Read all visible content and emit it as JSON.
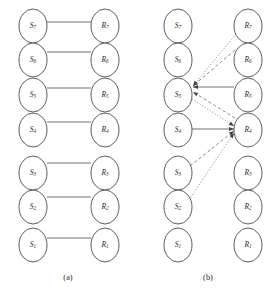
{
  "figure": {
    "background_color": "#ffffff",
    "stroke_color": "#4a4a4a",
    "panels": [
      {
        "id": "panel-a",
        "caption": "(a)",
        "caption_x": 68,
        "caption_y": 278,
        "source_column_x": 33,
        "receiver_column_x": 105,
        "nodes": [
          {
            "id": "a-s7",
            "base": "S",
            "sub": "7",
            "x": 33,
            "y": 26,
            "rx": 14,
            "ry": 17
          },
          {
            "id": "a-s6",
            "base": "S",
            "sub": "6",
            "x": 33,
            "y": 60,
            "rx": 14,
            "ry": 17
          },
          {
            "id": "a-s5",
            "base": "S",
            "sub": "5",
            "x": 33,
            "y": 95,
            "rx": 14,
            "ry": 17
          },
          {
            "id": "a-s4",
            "base": "S",
            "sub": "4",
            "x": 33,
            "y": 130,
            "rx": 14,
            "ry": 17
          },
          {
            "id": "a-s3",
            "base": "S",
            "sub": "3",
            "x": 33,
            "y": 173,
            "rx": 14,
            "ry": 17
          },
          {
            "id": "a-s2",
            "base": "S",
            "sub": "2",
            "x": 33,
            "y": 207,
            "rx": 14,
            "ry": 17
          },
          {
            "id": "a-s1",
            "base": "S",
            "sub": "1",
            "x": 33,
            "y": 245,
            "rx": 14,
            "ry": 17
          },
          {
            "id": "a-r7",
            "base": "R",
            "sub": "7",
            "x": 105,
            "y": 26,
            "rx": 14,
            "ry": 17
          },
          {
            "id": "a-r6",
            "base": "R",
            "sub": "6",
            "x": 105,
            "y": 60,
            "rx": 14,
            "ry": 17
          },
          {
            "id": "a-r5",
            "base": "R",
            "sub": "5",
            "x": 105,
            "y": 95,
            "rx": 14,
            "ry": 17
          },
          {
            "id": "a-r4",
            "base": "R",
            "sub": "4",
            "x": 105,
            "y": 130,
            "rx": 14,
            "ry": 17
          },
          {
            "id": "a-r3",
            "base": "R",
            "sub": "3",
            "x": 105,
            "y": 173,
            "rx": 14,
            "ry": 17
          },
          {
            "id": "a-r2",
            "base": "R",
            "sub": "2",
            "x": 105,
            "y": 207,
            "rx": 14,
            "ry": 17
          },
          {
            "id": "a-r1",
            "base": "R",
            "sub": "1",
            "x": 105,
            "y": 245,
            "rx": 14,
            "ry": 17
          }
        ],
        "edges": [
          {
            "id": "a-e7",
            "from": "a-s7",
            "to": "a-r7",
            "style": "solid",
            "arrow": "none",
            "x1": 47,
            "y1": 22,
            "x2": 91,
            "y2": 22
          },
          {
            "id": "a-e6",
            "from": "a-s6",
            "to": "a-r6",
            "style": "solid",
            "arrow": "none",
            "x1": 47,
            "y1": 52,
            "x2": 91,
            "y2": 52
          },
          {
            "id": "a-e5",
            "from": "a-s5",
            "to": "a-r5",
            "style": "solid",
            "arrow": "none",
            "x1": 47,
            "y1": 88,
            "x2": 91,
            "y2": 88
          },
          {
            "id": "a-e4",
            "from": "a-s4",
            "to": "a-r4",
            "style": "solid",
            "arrow": "none",
            "x1": 47,
            "y1": 122,
            "x2": 91,
            "y2": 122
          },
          {
            "id": "a-e3",
            "from": "a-s3",
            "to": "a-r3",
            "style": "solid",
            "arrow": "none",
            "x1": 47,
            "y1": 163,
            "x2": 91,
            "y2": 163
          },
          {
            "id": "a-e2",
            "from": "a-s2",
            "to": "a-r2",
            "style": "solid",
            "arrow": "none",
            "x1": 47,
            "y1": 197,
            "x2": 91,
            "y2": 197
          },
          {
            "id": "a-e1",
            "from": "a-s1",
            "to": "a-r1",
            "style": "solid",
            "arrow": "none",
            "x1": 47,
            "y1": 238,
            "x2": 91,
            "y2": 238
          }
        ]
      },
      {
        "id": "panel-b",
        "caption": "(b)",
        "caption_x": 208,
        "caption_y": 278,
        "source_column_x": 178,
        "receiver_column_x": 248,
        "nodes": [
          {
            "id": "b-s7",
            "base": "S",
            "sub": "7",
            "x": 178,
            "y": 26,
            "rx": 14,
            "ry": 17
          },
          {
            "id": "b-s6",
            "base": "S",
            "sub": "6",
            "x": 178,
            "y": 60,
            "rx": 14,
            "ry": 17
          },
          {
            "id": "b-s5",
            "base": "S",
            "sub": "5",
            "x": 178,
            "y": 95,
            "rx": 14,
            "ry": 17
          },
          {
            "id": "b-s4",
            "base": "S",
            "sub": "4",
            "x": 178,
            "y": 130,
            "rx": 14,
            "ry": 17
          },
          {
            "id": "b-s3",
            "base": "S",
            "sub": "3",
            "x": 178,
            "y": 173,
            "rx": 14,
            "ry": 17
          },
          {
            "id": "b-s2",
            "base": "S",
            "sub": "2",
            "x": 178,
            "y": 207,
            "rx": 14,
            "ry": 17
          },
          {
            "id": "b-s1",
            "base": "S",
            "sub": "1",
            "x": 178,
            "y": 245,
            "rx": 14,
            "ry": 17
          },
          {
            "id": "b-r7",
            "base": "R",
            "sub": "7",
            "x": 248,
            "y": 26,
            "rx": 14,
            "ry": 17
          },
          {
            "id": "b-r6",
            "base": "R",
            "sub": "6",
            "x": 248,
            "y": 60,
            "rx": 14,
            "ry": 17
          },
          {
            "id": "b-r5",
            "base": "R",
            "sub": "5",
            "x": 248,
            "y": 95,
            "rx": 14,
            "ry": 17
          },
          {
            "id": "b-r4",
            "base": "R",
            "sub": "4",
            "x": 248,
            "y": 130,
            "rx": 14,
            "ry": 17
          },
          {
            "id": "b-r3",
            "base": "R",
            "sub": "3",
            "x": 248,
            "y": 173,
            "rx": 14,
            "ry": 17
          },
          {
            "id": "b-r2",
            "base": "R",
            "sub": "2",
            "x": 248,
            "y": 207,
            "rx": 14,
            "ry": 17
          },
          {
            "id": "b-r1",
            "base": "R",
            "sub": "1",
            "x": 248,
            "y": 245,
            "rx": 14,
            "ry": 17
          }
        ],
        "edges": [
          {
            "id": "b-e-r7-s5",
            "from": "b-r7",
            "to": "b-s5",
            "style": "dotted",
            "arrow": "to",
            "x1": 236,
            "y1": 34,
            "x2": 193,
            "y2": 86
          },
          {
            "id": "b-e-r6-s5",
            "from": "b-r6",
            "to": "b-s5",
            "style": "dashed",
            "arrow": "to",
            "x1": 235,
            "y1": 50,
            "x2": 193,
            "y2": 86
          },
          {
            "id": "b-e-r5-s5",
            "from": "b-r5",
            "to": "b-s5",
            "style": "solid",
            "arrow": "to",
            "x1": 234,
            "y1": 87,
            "x2": 193,
            "y2": 87
          },
          {
            "id": "b-e-r4-s5",
            "from": "b-r4",
            "to": "b-s5",
            "style": "dashed",
            "arrow": "to",
            "x1": 235,
            "y1": 118,
            "x2": 193,
            "y2": 92
          },
          {
            "id": "b-e-s5-r4",
            "from": "b-s5",
            "to": "b-r4",
            "style": "dotted",
            "arrow": "to",
            "x1": 192,
            "y1": 99,
            "x2": 234,
            "y2": 126
          },
          {
            "id": "b-e-s4-r4",
            "from": "b-s4",
            "to": "b-r4",
            "style": "solid",
            "arrow": "to",
            "x1": 192,
            "y1": 129,
            "x2": 234,
            "y2": 129
          },
          {
            "id": "b-e-s3-r4",
            "from": "b-s3",
            "to": "b-r4",
            "style": "dashed",
            "arrow": "to",
            "x1": 190,
            "y1": 166,
            "x2": 234,
            "y2": 131
          },
          {
            "id": "b-e-s2-r4",
            "from": "b-s2",
            "to": "b-r4",
            "style": "dotted",
            "arrow": "to",
            "x1": 189,
            "y1": 200,
            "x2": 234,
            "y2": 133
          }
        ]
      }
    ]
  }
}
